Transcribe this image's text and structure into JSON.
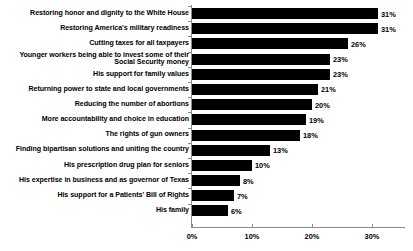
{
  "chart_data": {
    "type": "bar",
    "orientation": "horizontal",
    "title": "",
    "xlabel": "",
    "ylabel": "",
    "xlim": [
      0,
      35.5
    ],
    "grid": false,
    "legend": null,
    "value_suffix": "%",
    "categories": [
      "Restoring honor and dignity to the White House",
      "Restoring America's military readiness",
      "Cutting taxes for all taxpayers",
      "Younger workers being able to invest some of their\nSocial Security money",
      "His support for family values",
      "Returning power to state and local governments",
      "Reducing the number of abortions",
      "More accountability and choice in education",
      "The rights of gun owners",
      "Finding bipartisan solutions and uniting the country",
      "His prescription drug plan for seniors",
      "His expertise in business and as governor of Texas",
      "His support for a Patients' Bill of Rights",
      "His family"
    ],
    "values": [
      31,
      31,
      26,
      23,
      23,
      21,
      20,
      19,
      18,
      13,
      10,
      8,
      7,
      6
    ],
    "value_labels": [
      "31%",
      "31%",
      "26%",
      "23%",
      "23%",
      "21%",
      "20%",
      "19%",
      "18%",
      "13%",
      "10%",
      "8%",
      "7%",
      "6%"
    ],
    "xticks": [
      0,
      10,
      20,
      30
    ],
    "xtick_labels": [
      "0%",
      "10%",
      "20%",
      "30%"
    ],
    "bar_color": "#000000",
    "axis_color": "#8a8a8a",
    "text_color": "#000000",
    "background_color": "#ffffff"
  }
}
